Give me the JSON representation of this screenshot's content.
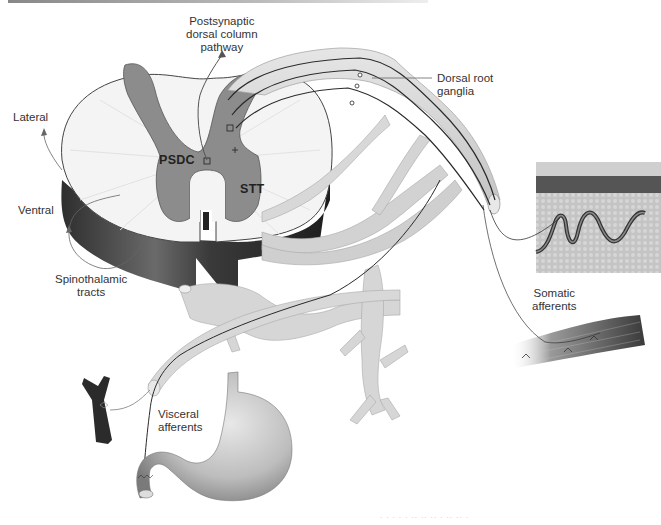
{
  "figure": {
    "type": "anatomical-diagram",
    "labels": {
      "postsynaptic": "Postsynaptic\ndorsal column\npathway",
      "postsynaptic_lines": [
        "Postsynaptic",
        "dorsal column",
        "pathway"
      ],
      "dorsal_root": [
        "Dorsal root",
        "ganglia"
      ],
      "lateral": "Lateral",
      "ventral": "Ventral",
      "spinothalamic": [
        "Spinothalamic",
        "tracts"
      ],
      "psdc": "PSDC",
      "stt": "STT",
      "somatic": [
        "Somatic",
        "afferents"
      ],
      "visceral": [
        "Visceral",
        "afferents"
      ]
    },
    "footer_text": "· · ·  · ·  ·· ·· ·· · ·· ·· ·",
    "colors": {
      "gray_matter": "#8c8c8c",
      "white_matter": "#f4f4f4",
      "cord_side": "#3a3a3a",
      "nerve": "#d6d6d6",
      "nerve_outline": "#a8a8a8",
      "fiber": "#2a2a2a",
      "skin_dark": "#555555",
      "tissue": "#bdbdbd",
      "vessel": "#2b2b2b",
      "stomach": "#c8c8c8"
    }
  }
}
